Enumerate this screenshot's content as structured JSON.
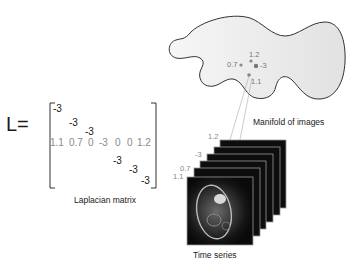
{
  "matrix": {
    "lhs": "L=",
    "caption": "Laplacian matrix",
    "diag_top": [
      "-3",
      "-3",
      "-3"
    ],
    "row_label_values": [
      "1.1",
      "0.7",
      "0",
      "-3",
      "0",
      "0",
      "1.2"
    ],
    "diag_bottom": [
      "-3",
      "-3",
      "-3"
    ]
  },
  "manifold": {
    "caption": "Manifold of images",
    "points": [
      {
        "label": "1.2"
      },
      {
        "label": "0.7"
      },
      {
        "label": "-3"
      },
      {
        "label": "1.1"
      }
    ],
    "fill_color": "#efefef",
    "stroke_color": "#333333"
  },
  "time_series": {
    "caption": "Time series",
    "frame_labels": [
      "1.2",
      "-3",
      "0.7",
      "1.1"
    ],
    "frame_count": 6,
    "frame_color": "#0d0d0d",
    "frame_border": "#9a9a9a"
  }
}
